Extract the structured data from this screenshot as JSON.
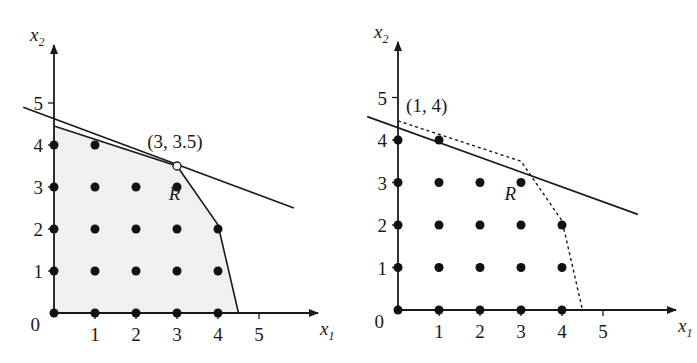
{
  "panels": [
    {
      "id": "left",
      "origin_px": [
        54,
        313
      ],
      "unit_x_px": 41,
      "unit_y_px": 42,
      "axis_x_end_px": 318,
      "axis_y_end_px": 45,
      "x_axis_label": "x",
      "x_axis_sub": "1",
      "y_axis_label": "x",
      "y_axis_sub": "2",
      "origin_label": "0",
      "x_ticks": [
        "1",
        "2",
        "3",
        "4",
        "5"
      ],
      "y_ticks": [
        "1",
        "2",
        "3",
        "4",
        "5"
      ],
      "region_label": "R",
      "region_fill": "#f0f0f0",
      "point_label": "(3, 3.5)",
      "highlighted_point": [
        3,
        3.5
      ],
      "integer_points": [
        [
          0,
          0
        ],
        [
          1,
          0
        ],
        [
          2,
          0
        ],
        [
          3,
          0
        ],
        [
          4,
          0
        ],
        [
          0,
          1
        ],
        [
          1,
          1
        ],
        [
          2,
          1
        ],
        [
          3,
          1
        ],
        [
          4,
          1
        ],
        [
          0,
          2
        ],
        [
          1,
          2
        ],
        [
          2,
          2
        ],
        [
          3,
          2
        ],
        [
          4,
          2
        ],
        [
          0,
          3
        ],
        [
          1,
          3
        ],
        [
          2,
          3
        ],
        [
          3,
          3
        ],
        [
          0,
          4
        ],
        [
          1,
          4
        ]
      ],
      "feasible_polygon": [
        [
          0,
          0
        ],
        [
          0,
          4.45
        ],
        [
          3,
          3.5
        ],
        [
          4,
          2.1
        ],
        [
          4.5,
          0
        ]
      ],
      "objective_line": [
        [
          -0.75,
          4.9
        ],
        [
          5.85,
          2.5
        ]
      ]
    },
    {
      "id": "right",
      "origin_px": [
        398,
        310
      ],
      "unit_x_px": 41,
      "unit_y_px": 42.5,
      "axis_x_end_px": 676,
      "axis_y_end_px": 42,
      "x_axis_label": "x",
      "x_axis_sub": "1",
      "y_axis_label": "x",
      "y_axis_sub": "2",
      "origin_label": "0",
      "x_ticks": [
        "1",
        "2",
        "3",
        "4",
        "5"
      ],
      "y_ticks": [
        "1",
        "2",
        "3",
        "4",
        "5"
      ],
      "region_label": "R",
      "point_label": "(1, 4)",
      "highlighted_point": [
        1,
        4
      ],
      "integer_points": [
        [
          0,
          0
        ],
        [
          1,
          0
        ],
        [
          2,
          0
        ],
        [
          3,
          0
        ],
        [
          4,
          0
        ],
        [
          0,
          1
        ],
        [
          1,
          1
        ],
        [
          2,
          1
        ],
        [
          3,
          1
        ],
        [
          4,
          1
        ],
        [
          0,
          2
        ],
        [
          1,
          2
        ],
        [
          2,
          2
        ],
        [
          3,
          2
        ],
        [
          4,
          2
        ],
        [
          0,
          3
        ],
        [
          1,
          3
        ],
        [
          2,
          3
        ],
        [
          3,
          3
        ],
        [
          0,
          4
        ],
        [
          1,
          4
        ]
      ],
      "relaxation_boundary_dashed": [
        [
          0,
          4.45
        ],
        [
          3,
          3.5
        ],
        [
          4,
          2.1
        ],
        [
          4.5,
          0
        ]
      ],
      "objective_line": [
        [
          -0.75,
          4.55
        ],
        [
          5.85,
          2.25
        ]
      ]
    }
  ]
}
